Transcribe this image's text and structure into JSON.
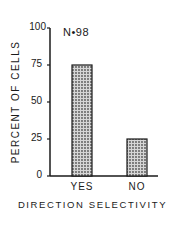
{
  "chart_data": {
    "type": "bar",
    "title": "",
    "annotation": "N•98",
    "xlabel": "DIRECTION SELECTIVITY",
    "ylabel": "PERCENT OF CELLS",
    "categories": [
      "YES",
      "NO"
    ],
    "values": [
      75,
      25
    ],
    "ylim": [
      0,
      100
    ],
    "yticks": [
      0,
      25,
      50,
      75,
      100
    ],
    "grid": false,
    "legend": null,
    "bar_fill": "stippled gray",
    "colors": {
      "axis": "#1a1a1a",
      "bar_fill": "#b5b5b5",
      "bar_edge": "#1a1a1a"
    }
  },
  "labels": {
    "annotation": "N•98",
    "xlabel": "DIRECTION SELECTIVITY",
    "ylabel": "PERCENT OF CELLS",
    "yticks": [
      "0",
      "25",
      "50",
      "75",
      "100"
    ],
    "xticks": [
      "YES",
      "NO"
    ]
  }
}
